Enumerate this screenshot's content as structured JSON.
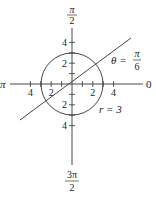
{
  "figure": {
    "type": "polar-diagram",
    "curves": [
      {
        "name": "circle",
        "equation": "r = 3",
        "label": "r = 3",
        "radius": 3
      },
      {
        "name": "line",
        "equation": "θ = π/6",
        "label_lhs": "θ =",
        "label_num": "π",
        "label_den": "6",
        "theta": "π/6"
      }
    ],
    "angle_labels": {
      "zero": "0",
      "half_pi": {
        "num": "π",
        "den": "2"
      },
      "pi": "π",
      "three_half_pi": {
        "num": "3π",
        "den": "2"
      }
    },
    "axis_ticks": {
      "horizontal": [
        {
          "value": -4,
          "label": "4"
        },
        {
          "value": -3,
          "label": ""
        },
        {
          "value": -2,
          "label": "2"
        },
        {
          "value": -1,
          "label": ""
        },
        {
          "value": 1,
          "label": ""
        },
        {
          "value": 2,
          "label": "2"
        },
        {
          "value": 3,
          "label": ""
        },
        {
          "value": 4,
          "label": "4"
        }
      ],
      "vertical": [
        {
          "value": 4,
          "label": "4"
        },
        {
          "value": 3,
          "label": ""
        },
        {
          "value": 2,
          "label": "2"
        },
        {
          "value": 1,
          "label": ""
        },
        {
          "value": -1,
          "label": ""
        },
        {
          "value": -2,
          "label": "2"
        },
        {
          "value": -3,
          "label": ""
        },
        {
          "value": -4,
          "label": "4"
        }
      ],
      "range": [
        -5.5,
        6.9
      ]
    },
    "colors": {
      "stroke": "#333333",
      "text": "#222222"
    }
  }
}
